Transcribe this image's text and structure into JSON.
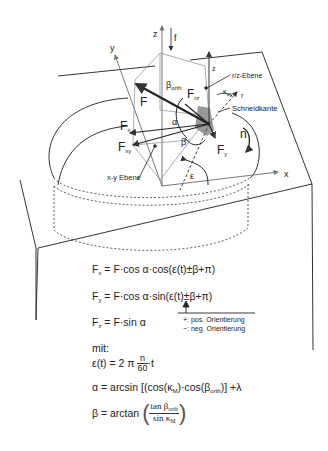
{
  "diagram": {
    "axes": {
      "x": "x",
      "y": "y",
      "z": "z",
      "z_local": "z",
      "r": "r"
    },
    "feed_label": "f",
    "rotation_label": "n",
    "forces": {
      "F": "F",
      "Fx": {
        "main": "F",
        "sub": "x"
      },
      "Fy": {
        "main": "F",
        "sub": "y"
      },
      "Fz": {
        "main": "F",
        "sub": "z"
      },
      "Fxy": {
        "main": "F",
        "sub": "xy"
      },
      "Frz": {
        "main": "F",
        "sub": "rz"
      }
    },
    "angles": {
      "alpha": "α",
      "beta": "β",
      "beta_orth": {
        "main": "β",
        "sub": "orth"
      },
      "epsilon": "ε",
      "kappa_vy": {
        "main": "κ",
        "sub": "vy"
      }
    },
    "planes": {
      "rz_plane": "r/z-Ebene",
      "xy_plane": "x-y Ebene",
      "cutting_edge": "Schneidkante"
    }
  },
  "formulas": {
    "fx": {
      "lhs_main": "F",
      "lhs_sub": "x",
      "rhs": "= F·cos α·cos(ε(t)±β+π)"
    },
    "fy": {
      "lhs_main": "F",
      "lhs_sub": "y",
      "rhs": "= F·cos α·sin(ε(t)±β+π)"
    },
    "fz": {
      "lhs_main": "F",
      "lhs_sub": "z",
      "rhs": "= F·sin α"
    },
    "orientation_note": {
      "pos": "+: pos. Orientierung",
      "neg": "−: neg. Orientierung"
    },
    "mit": "mit:",
    "epsilon": {
      "lhs": "ε(t) = 2 π",
      "frac_num": "n",
      "frac_den": "60",
      "tail": "·t"
    },
    "alpha": {
      "lhs": "α = arcsin [(cos(κ",
      "k_sub": "M",
      "mid": ")·cos(β",
      "b_sub": "orth",
      "tail": ")] +λ"
    },
    "beta": {
      "lhs": "β = arctan",
      "num_main": "tan β",
      "num_sub": "orth",
      "den_main": "sin κ",
      "den_sub": "M"
    }
  }
}
